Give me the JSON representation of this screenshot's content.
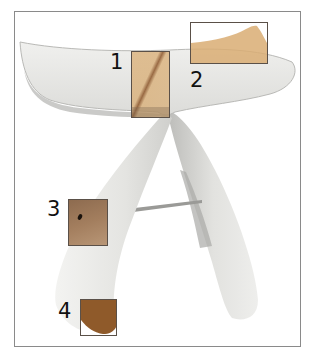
{
  "figure": {
    "colors": {
      "stool_white": "#e9e9e7",
      "stool_shadow": "#c9c9c6",
      "highlight_light": "#d9ad73",
      "highlight_dark": "#8f5a2a",
      "box_border": "#5a5048",
      "frame_border": "#8a8a8a"
    }
  },
  "callouts": [
    {
      "label": "1",
      "region": "center joint of seat"
    },
    {
      "label": "2",
      "region": "right seat wing tip"
    },
    {
      "label": "3",
      "region": "left leg mid (with dark spot)"
    },
    {
      "label": "4",
      "region": "left leg foot"
    }
  ]
}
